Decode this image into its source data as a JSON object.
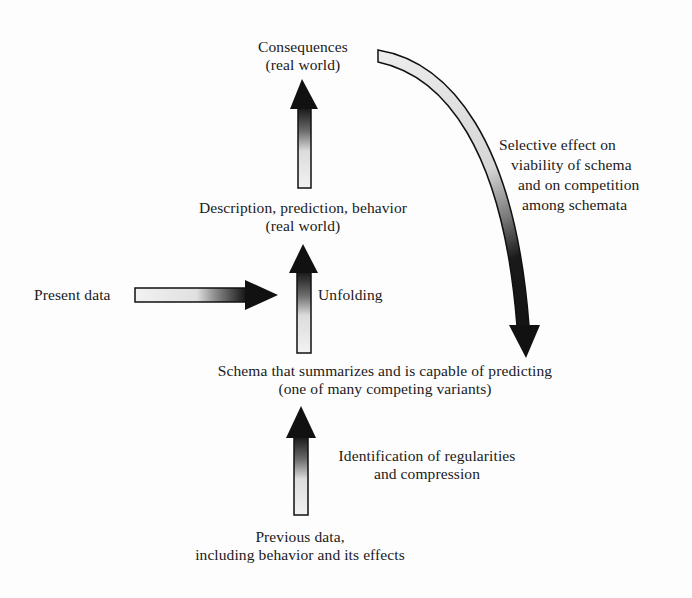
{
  "diagram": {
    "nodes": {
      "consequences": {
        "line1": "Consequences",
        "line2": "(real world)"
      },
      "description": {
        "line1": "Description, prediction, behavior",
        "line2": "(real world)"
      },
      "present_data": {
        "line1": "Present data"
      },
      "schema": {
        "line1": "Schema that summarizes and is capable of predicting",
        "line2": "(one of many competing variants)"
      },
      "previous_data": {
        "line1": "Previous data,",
        "line2": "including behavior and its effects"
      }
    },
    "edge_labels": {
      "unfolding": "Unfolding",
      "identification": {
        "line1": "Identification of regularities",
        "line2": "and compression"
      },
      "selective_effect": {
        "line1": "Selective effect on",
        "line2": "viability of schema",
        "line3": "and on competition",
        "line4": "among schemata"
      }
    },
    "edges": [
      {
        "from": "previous_data",
        "to": "schema",
        "label": "identification"
      },
      {
        "from": "schema",
        "to": "description",
        "label": "unfolding"
      },
      {
        "from": "present_data",
        "to": "unfolding_arrow",
        "label": ""
      },
      {
        "from": "description",
        "to": "consequences",
        "label": ""
      },
      {
        "from": "consequences",
        "to": "schema",
        "label": "selective_effect"
      }
    ],
    "colors": {
      "arrow_dark": "#111111",
      "arrow_light": "#efefef",
      "text": "#1a1a1a"
    }
  }
}
